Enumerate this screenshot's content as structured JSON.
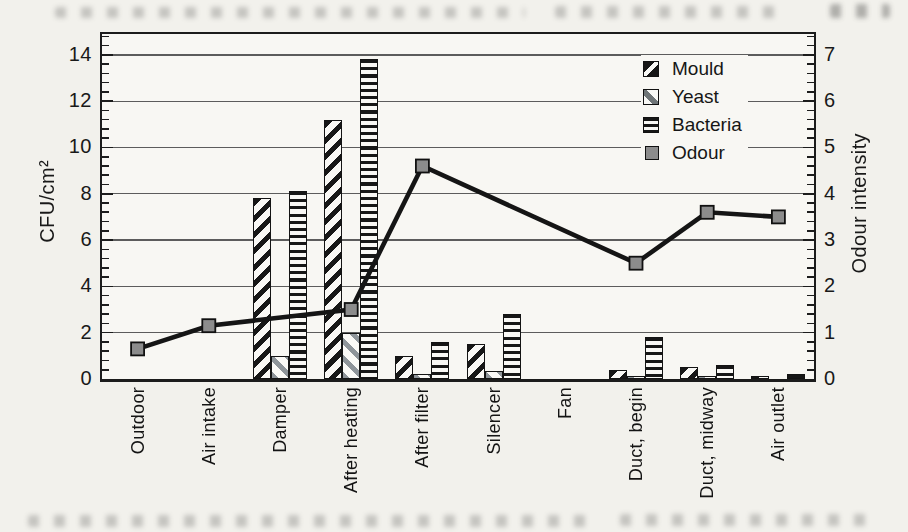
{
  "figure": {
    "kind": "scanned book figure",
    "background": "#f2f1ec"
  },
  "colors": {
    "ink": "#1c1c1c",
    "gridline": "#5c5c5c",
    "odour_marker_fill": "#8c8c8c",
    "yeast_stripe_gray": "#8f959a"
  },
  "chart_data": {
    "type": "bar+line combo",
    "title": "",
    "categories": [
      "Outdoor",
      "Air intake",
      "Damper",
      "After heating",
      "After filter",
      "Silencer",
      "Fan",
      "Duct, begin",
      "Duct, midway",
      "Air outlet"
    ],
    "series": [
      {
        "name": "Mould",
        "type": "bar",
        "axis": "left",
        "pattern": "black diagonal hatch rising right",
        "values": [
          0,
          0,
          7.8,
          11.2,
          1.0,
          1.5,
          0,
          0.4,
          0.5,
          0.15
        ]
      },
      {
        "name": "Yeast",
        "type": "bar",
        "axis": "left",
        "pattern": "gray diagonal hatch falling right",
        "values": [
          0,
          0,
          1.0,
          2.0,
          0.2,
          0.35,
          0,
          0.1,
          0.15,
          0
        ]
      },
      {
        "name": "Bacteria",
        "type": "bar",
        "axis": "left",
        "pattern": "black horizontal stripes",
        "values": [
          0,
          0,
          8.1,
          13.8,
          1.6,
          2.8,
          0,
          1.8,
          0.6,
          0.2
        ]
      },
      {
        "name": "Odour",
        "type": "line",
        "axis": "right",
        "marker": "gray filled square",
        "values": [
          0.65,
          1.15,
          null,
          1.5,
          4.6,
          null,
          null,
          2.5,
          3.6,
          3.5
        ]
      }
    ],
    "left_axis": {
      "label": "CFU/cm²",
      "ticks": [
        0,
        2,
        4,
        6,
        8,
        10,
        12,
        14
      ],
      "range": [
        0,
        14.9
      ],
      "minor_tick_step": 0.4,
      "gridlines": "horizontal at major ticks"
    },
    "right_axis": {
      "label": "Odour intensity",
      "ticks": [
        0,
        1,
        2,
        3,
        4,
        5,
        6,
        7
      ],
      "range": [
        0,
        7.45
      ],
      "minor_tick_step": 0.2
    },
    "legend": {
      "position": "top-right inside plot",
      "items": [
        "Mould",
        "Yeast",
        "Bacteria",
        "Odour"
      ]
    }
  }
}
